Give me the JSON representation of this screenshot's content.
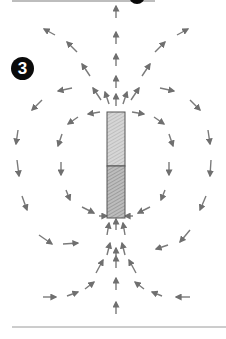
{
  "figure": {
    "step_number": "3",
    "colors": {
      "arrow": "#7a7a7a",
      "magnet_outline": "#555555",
      "magnet_top_fill": "#cfcfcf",
      "magnet_bottom_fill": "#b0b0b0",
      "badge": "#0a0a0a",
      "rule": "#9a9a9a"
    },
    "magnet": {
      "x": 107,
      "y": 112,
      "width": 18,
      "height": 106,
      "divider_y": 166
    },
    "arrows": [
      [
        116,
        18,
        116,
        6
      ],
      [
        116,
        44,
        116,
        32
      ],
      [
        116,
        66,
        116,
        54
      ],
      [
        116,
        88,
        116,
        76
      ],
      [
        116,
        106,
        116,
        94
      ],
      [
        109,
        104,
        105,
        92
      ],
      [
        123,
        104,
        127,
        92
      ],
      [
        101,
        100,
        93,
        88
      ],
      [
        131,
        100,
        139,
        88
      ],
      [
        90,
        76,
        82,
        64
      ],
      [
        142,
        76,
        150,
        64
      ],
      [
        77,
        52,
        67,
        42
      ],
      [
        155,
        52,
        165,
        42
      ],
      [
        55,
        35,
        44,
        29
      ],
      [
        177,
        35,
        188,
        29
      ],
      [
        100,
        112,
        88,
        114
      ],
      [
        132,
        112,
        144,
        114
      ],
      [
        78,
        117,
        68,
        124
      ],
      [
        154,
        117,
        164,
        124
      ],
      [
        62,
        134,
        58,
        146
      ],
      [
        169,
        134,
        173,
        146
      ],
      [
        61,
        162,
        61,
        175
      ],
      [
        169,
        162,
        169,
        175
      ],
      [
        66,
        190,
        70,
        200
      ],
      [
        165,
        190,
        161,
        200
      ],
      [
        82,
        207,
        94,
        213
      ],
      [
        150,
        207,
        138,
        213
      ],
      [
        99,
        216,
        107,
        216
      ],
      [
        133,
        216,
        125,
        216
      ],
      [
        72,
        88,
        58,
        91
      ],
      [
        160,
        88,
        174,
        91
      ],
      [
        42,
        100,
        32,
        110
      ],
      [
        190,
        100,
        200,
        110
      ],
      [
        18,
        130,
        16,
        144
      ],
      [
        208,
        130,
        210,
        144
      ],
      [
        17,
        160,
        19,
        176
      ],
      [
        211,
        160,
        210,
        176
      ],
      [
        22,
        196,
        27,
        210
      ],
      [
        206,
        196,
        200,
        210
      ],
      [
        39,
        235,
        52,
        244
      ],
      [
        190,
        230,
        180,
        242
      ],
      [
        63,
        244,
        78,
        243
      ],
      [
        168,
        245,
        156,
        249
      ],
      [
        107,
        235,
        109,
        223
      ],
      [
        125,
        235,
        123,
        223
      ],
      [
        116,
        230,
        116,
        219
      ],
      [
        107,
        255,
        110,
        243
      ],
      [
        125,
        255,
        122,
        243
      ],
      [
        96,
        273,
        103,
        260
      ],
      [
        136,
        273,
        129,
        260
      ],
      [
        85,
        289,
        94,
        282
      ],
      [
        144,
        289,
        135,
        282
      ],
      [
        67,
        296,
        78,
        292
      ],
      [
        162,
        296,
        152,
        292
      ],
      [
        43,
        297,
        56,
        297
      ],
      [
        190,
        297,
        176,
        297
      ],
      [
        116,
        268,
        116,
        256
      ],
      [
        116,
        290,
        116,
        278
      ],
      [
        116,
        314,
        116,
        302
      ],
      [
        116,
        258,
        116,
        248
      ]
    ]
  }
}
